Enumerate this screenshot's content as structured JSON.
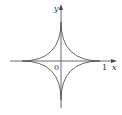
{
  "figure": {
    "curve": "astroid",
    "equation_hint": "x^(2/3) + y^(2/3) = 1",
    "labels": {
      "x_axis": "x",
      "y_axis": "y",
      "origin": "0",
      "x_tick": "1"
    },
    "colors": {
      "curve": "#555555",
      "axes": "#444444",
      "background": "#ffffff"
    }
  }
}
